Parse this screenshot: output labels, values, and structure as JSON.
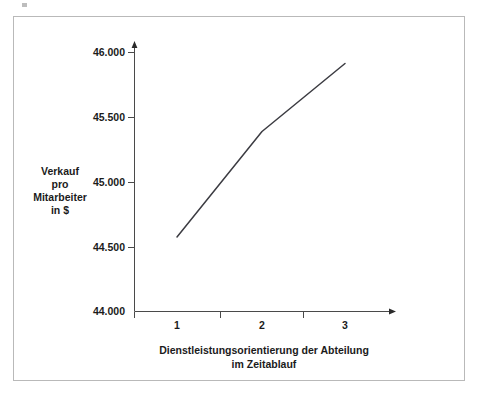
{
  "chart_data": {
    "type": "line",
    "title": "",
    "subtitle": "",
    "xlabel_lines": [
      "Dienstleistungsorientierung der Abteilung",
      "im Zeitablauf"
    ],
    "ylabel_lines": [
      "Verkauf",
      "pro",
      "Mitarbeiter",
      "in $"
    ],
    "categories": [
      "1",
      "2",
      "3"
    ],
    "x": [
      1,
      2,
      3
    ],
    "values": [
      44575,
      45390,
      45915
    ],
    "series": [
      {
        "name": "Verkauf pro Mitarbeiter",
        "values": [
          44575,
          45390,
          45915
        ]
      }
    ],
    "xlim": [
      0.5,
      3.5
    ],
    "ylim": [
      44000,
      46000
    ],
    "ytick_labels": [
      "46.000",
      "45.500",
      "45.000",
      "44.500",
      "44.000"
    ],
    "ytick_values": [
      46000,
      45500,
      45000,
      44500,
      44000
    ],
    "xtick_labels": [
      "1",
      "2",
      "3"
    ],
    "grid": false,
    "legend": null,
    "legend_position": "none",
    "line_color": "#3c3c42",
    "axis_color": "#4a4a4a",
    "text_color": "#1b1b1b",
    "frame_border_color": "#b9b9b9",
    "background_color": "#ffffff",
    "axis_style": "arrow-ended open axes"
  },
  "axes": {
    "y_tick_0": "46.000",
    "y_tick_1": "45.500",
    "y_tick_2": "45.000",
    "y_tick_3": "44.500",
    "y_tick_4": "44.000",
    "x_tick_0": "1",
    "x_tick_1": "2",
    "x_tick_2": "3",
    "y_title_line_0": "Verkauf",
    "y_title_line_1": "pro",
    "y_title_line_2": "Mitarbeiter",
    "y_title_line_3": "in $",
    "x_title_line_0": "Dienstleistungsorientierung der Abteilung",
    "x_title_line_1": "im Zeitablauf"
  }
}
